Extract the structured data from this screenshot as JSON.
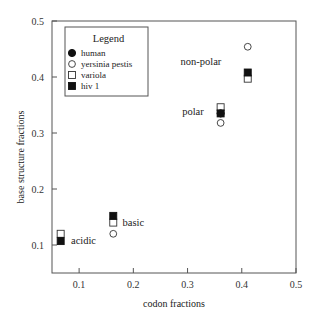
{
  "chart_data": {
    "type": "scatter",
    "title": "",
    "xlabel": "codon fractions",
    "ylabel": "base structure fractions",
    "xlim": [
      0.05,
      0.5
    ],
    "ylim": [
      0.05,
      0.5
    ],
    "xticks": [
      0.1,
      0.2,
      0.3,
      0.4,
      0.5
    ],
    "yticks": [
      0.1,
      0.2,
      0.3,
      0.4,
      0.5
    ],
    "xtick_labels": [
      "0.1",
      "0.2",
      "0.3",
      "0.4",
      "0.5"
    ],
    "ytick_labels": [
      "0.1",
      "0.2",
      "0.3",
      "0.4",
      "0.5"
    ],
    "grid": false,
    "legend": {
      "title": "Legend",
      "position": "upper left",
      "entries": [
        {
          "name": "human",
          "marker": "filled-circle"
        },
        {
          "name": "yersinia pestis",
          "marker": "open-circle"
        },
        {
          "name": "variola",
          "marker": "open-square"
        },
        {
          "name": "hiv 1",
          "marker": "filled-square"
        }
      ]
    },
    "groups": [
      {
        "label": "acidic",
        "x": 0.066
      },
      {
        "label": "basic",
        "x": 0.163
      },
      {
        "label": "polar",
        "x": 0.361
      },
      {
        "label": "non-polar",
        "x": 0.411
      }
    ],
    "series": [
      {
        "name": "human",
        "marker": "filled-circle",
        "points": [
          {
            "group": "polar",
            "x": 0.361,
            "y": 0.335
          }
        ]
      },
      {
        "name": "yersinia pestis",
        "marker": "open-circle",
        "points": [
          {
            "group": "basic",
            "x": 0.163,
            "y": 0.12
          },
          {
            "group": "polar",
            "x": 0.361,
            "y": 0.318
          },
          {
            "group": "non-polar",
            "x": 0.411,
            "y": 0.454
          }
        ]
      },
      {
        "name": "variola",
        "marker": "open-square",
        "points": [
          {
            "group": "acidic",
            "x": 0.066,
            "y": 0.12
          },
          {
            "group": "basic",
            "x": 0.163,
            "y": 0.14
          },
          {
            "group": "polar",
            "x": 0.361,
            "y": 0.346
          },
          {
            "group": "non-polar",
            "x": 0.411,
            "y": 0.397
          }
        ]
      },
      {
        "name": "hiv 1",
        "marker": "filled-square",
        "points": [
          {
            "group": "acidic",
            "x": 0.066,
            "y": 0.107
          },
          {
            "group": "basic",
            "x": 0.163,
            "y": 0.152
          },
          {
            "group": "polar",
            "x": 0.361,
            "y": 0.335
          },
          {
            "group": "non-polar",
            "x": 0.411,
            "y": 0.408
          }
        ]
      }
    ],
    "annotations": [
      {
        "text": "acidic",
        "x": 0.085,
        "y": 0.108
      },
      {
        "text": "basic",
        "x": 0.18,
        "y": 0.14
      },
      {
        "text": "polar",
        "x": 0.29,
        "y": 0.338
      },
      {
        "text": "non-polar",
        "x": 0.287,
        "y": 0.428
      }
    ]
  },
  "layout": {
    "plot": {
      "left": 52,
      "top": 21,
      "right": 296,
      "bottom": 273
    },
    "colors": {
      "axis": "#555555",
      "marker_fill": "#111111",
      "marker_edge": "#333333",
      "legend_border": "#555555"
    }
  }
}
